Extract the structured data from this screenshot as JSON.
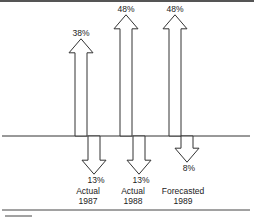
{
  "chart_data": {
    "type": "bar",
    "style": "bidirectional-arrows",
    "title": "",
    "xlabel": "",
    "ylabel": "",
    "categories": [
      "Actual 1987",
      "Actual 1988",
      "Forecasted 1989"
    ],
    "category_lines": [
      [
        "Actual",
        "1987"
      ],
      [
        "Actual",
        "1988"
      ],
      [
        "Forecasted",
        "1989"
      ]
    ],
    "series": [
      {
        "name": "Up",
        "direction": "up",
        "values": [
          38,
          48,
          48
        ],
        "labels": [
          "38%",
          "48%",
          "48%"
        ]
      },
      {
        "name": "Down",
        "direction": "down",
        "values": [
          13,
          13,
          8
        ],
        "labels": [
          "13%",
          "13%",
          "8%"
        ]
      }
    ],
    "unit": "%",
    "grid": false,
    "legend": null,
    "colors": {
      "stroke": "#333333",
      "fill": "#ffffff",
      "rule": "#444444"
    }
  }
}
